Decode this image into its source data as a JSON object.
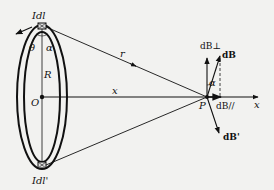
{
  "diagram": {
    "type": "physics-diagram",
    "labels": {
      "current_element_top": "Idl",
      "current_element_bottom": "Idl'",
      "angle_theta": "θ",
      "angle_alpha_ring": "α",
      "radius": "R",
      "center": "O",
      "distance_r": "r",
      "distance_x": "x",
      "point": "P",
      "axis": "x",
      "dB_perp": "dB⊥",
      "dB": "dB",
      "dB_prime": "dB'",
      "dB_parallel": "dB//",
      "angle_alpha_P": "α"
    },
    "colors": {
      "ink": "#111111",
      "background": "#f2f2f0"
    }
  }
}
